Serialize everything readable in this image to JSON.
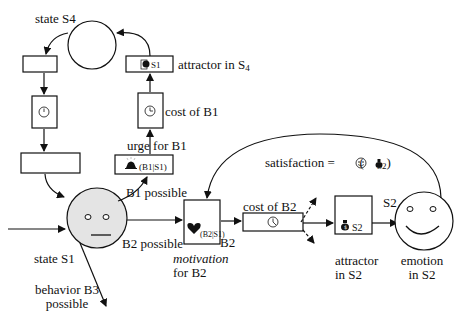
{
  "diagram": {
    "type": "state-transition / motivation model",
    "colors": {
      "stroke": "#111111",
      "face_s1_fill": "#e4e4e4",
      "background": "#ffffff"
    },
    "nodes": {
      "state_s4": {
        "label": "state S4",
        "shape": "circle"
      },
      "state_s1": {
        "label": "state S1",
        "shape": "neutral-face"
      },
      "emotion_s2": {
        "label_line1": "emotion",
        "label_line2": "in S2",
        "shape": "smiling-face"
      },
      "attractor_s4": {
        "label": "attractor in S",
        "label_sub": "4",
        "content_glyph": "heart-icon",
        "content_sub": "S1"
      },
      "cost_b1": {
        "label": "cost of B1",
        "content_glyph": "clock-icon"
      },
      "urge_b1": {
        "label": "urge for B1",
        "content_glyph": "bell-icon",
        "content_text": "(B1|S1)"
      },
      "left_top_box": {
        "label": ""
      },
      "left_clock_box": {
        "content_glyph": "clock-icon"
      },
      "left_wide_box": {
        "label": ""
      },
      "motivation_b2": {
        "label_line1": "motivation",
        "label_line2": "for B2",
        "content_glyph": "heart-icon",
        "content_text": "(B2|S1)",
        "side_label": "B2"
      },
      "cost_b2": {
        "label": "cost of B2",
        "content_glyph": "clock-icon"
      },
      "attractor_s2": {
        "label_line1": "attractor",
        "label_line2": "in S2",
        "content_glyph": "money-bag-icon",
        "content_text": "S2"
      }
    },
    "edge_labels": {
      "b1_possible": "B1 possible",
      "b2_possible": "B2 possible",
      "b3_line1": "behavior B3",
      "b3_line2": "possible",
      "s2_entry": "S2"
    },
    "satisfaction": {
      "label": "satisfaction",
      "equals": "= ☺ (",
      "bag": "▲",
      "sub": "S2",
      "close": ")"
    },
    "glyphs": {
      "clock": "◷",
      "heart": "♥",
      "bell": "▲",
      "bag": "▲",
      "smiley": "☺"
    }
  }
}
